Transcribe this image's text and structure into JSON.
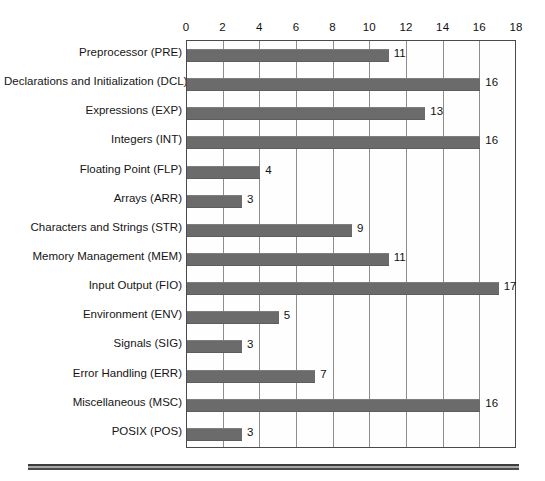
{
  "chart_data": {
    "type": "bar",
    "orientation": "horizontal",
    "title": "",
    "xlabel": "",
    "ylabel": "",
    "xlim": [
      0,
      18
    ],
    "xticks": [
      0,
      2,
      4,
      6,
      8,
      10,
      12,
      14,
      16,
      18
    ],
    "grid": "vertical",
    "legend": "none",
    "bar_color": "#6b6b6b",
    "categories": [
      "Preprocessor (PRE)",
      "Declarations and Initialization (DCL)",
      "Expressions (EXP)",
      "Integers (INT)",
      "Floating Point (FLP)",
      "Arrays (ARR)",
      "Characters and Strings (STR)",
      "Memory Management (MEM)",
      "Input Output (FIO)",
      "Environment (ENV)",
      "Signals (SIG)",
      "Error Handling (ERR)",
      "Miscellaneous (MSC)",
      "POSIX (POS)"
    ],
    "values": [
      11,
      16,
      13,
      16,
      4,
      3,
      9,
      11,
      17,
      5,
      3,
      7,
      16,
      3
    ],
    "data_labels": [
      "11",
      "16",
      "13",
      "16",
      "4",
      "3",
      "9",
      "11",
      "17",
      "5",
      "3",
      "7",
      "16",
      "3"
    ]
  }
}
